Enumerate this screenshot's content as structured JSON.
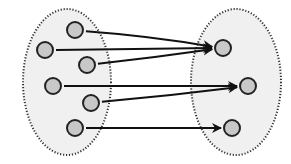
{
  "diagram": {
    "type": "mapping",
    "colors": {
      "set_fill": "#f0f0f0",
      "set_border": "#333333",
      "node_fill": "#c8c8c8",
      "node_border": "#222222",
      "arrow": "#111111"
    },
    "sets": [
      {
        "id": "domain",
        "cx": 67,
        "cy": 82,
        "rx": 44,
        "ry": 73
      },
      {
        "id": "codomain",
        "cx": 236,
        "cy": 82,
        "rx": 45,
        "ry": 73
      }
    ],
    "nodes": [
      {
        "id": "a1",
        "set": "domain",
        "x": 75,
        "y": 30
      },
      {
        "id": "a2",
        "set": "domain",
        "x": 45,
        "y": 50
      },
      {
        "id": "a3",
        "set": "domain",
        "x": 87,
        "y": 65
      },
      {
        "id": "a4",
        "set": "domain",
        "x": 53,
        "y": 86
      },
      {
        "id": "a5",
        "set": "domain",
        "x": 91,
        "y": 103
      },
      {
        "id": "a6",
        "set": "domain",
        "x": 75,
        "y": 128
      },
      {
        "id": "b1",
        "set": "codomain",
        "x": 223,
        "y": 48
      },
      {
        "id": "b2",
        "set": "codomain",
        "x": 248,
        "y": 86
      },
      {
        "id": "b3",
        "set": "codomain",
        "x": 232,
        "y": 128
      }
    ],
    "edges": [
      {
        "from": "a1",
        "to": "b1"
      },
      {
        "from": "a2",
        "to": "b1"
      },
      {
        "from": "a3",
        "to": "b1"
      },
      {
        "from": "a4",
        "to": "b2"
      },
      {
        "from": "a5",
        "to": "b2"
      },
      {
        "from": "a6",
        "to": "b3"
      }
    ]
  }
}
